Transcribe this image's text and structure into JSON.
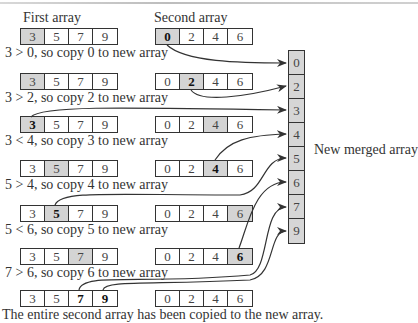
{
  "headers": {
    "first": "First array",
    "second": "Second array"
  },
  "steps": [
    {
      "first": [
        "3",
        "5",
        "7",
        "9"
      ],
      "first_shade": [
        0
      ],
      "first_bold": [],
      "second": [
        "0",
        "2",
        "4",
        "6"
      ],
      "second_shade": [
        0
      ],
      "second_bold": [
        0
      ],
      "caption": "3 > 0, so copy 0 to new array"
    },
    {
      "first": [
        "3",
        "5",
        "7",
        "9"
      ],
      "first_shade": [
        0
      ],
      "first_bold": [],
      "second": [
        "0",
        "2",
        "4",
        "6"
      ],
      "second_shade": [
        1
      ],
      "second_bold": [
        1
      ],
      "caption": "3 > 2, so copy 2 to new array"
    },
    {
      "first": [
        "3",
        "5",
        "7",
        "9"
      ],
      "first_shade": [
        0
      ],
      "first_bold": [
        0
      ],
      "second": [
        "0",
        "2",
        "4",
        "6"
      ],
      "second_shade": [
        2
      ],
      "second_bold": [],
      "caption": "3 < 4, so copy 3 to new array"
    },
    {
      "first": [
        "3",
        "5",
        "7",
        "9"
      ],
      "first_shade": [
        1
      ],
      "first_bold": [],
      "second": [
        "0",
        "2",
        "4",
        "6"
      ],
      "second_shade": [
        2
      ],
      "second_bold": [
        2
      ],
      "caption": "5 > 4, so copy 4 to new array"
    },
    {
      "first": [
        "3",
        "5",
        "7",
        "9"
      ],
      "first_shade": [
        1
      ],
      "first_bold": [
        1
      ],
      "second": [
        "0",
        "2",
        "4",
        "6"
      ],
      "second_shade": [
        3
      ],
      "second_bold": [],
      "caption": "5 < 6, so copy 5 to new array"
    },
    {
      "first": [
        "3",
        "5",
        "7",
        "9"
      ],
      "first_shade": [
        2
      ],
      "first_bold": [],
      "second": [
        "0",
        "2",
        "4",
        "6"
      ],
      "second_shade": [
        3
      ],
      "second_bold": [
        3
      ],
      "caption": "7 > 6, so copy 6 to new array"
    },
    {
      "first": [
        "3",
        "5",
        "7",
        "9"
      ],
      "first_shade": [],
      "first_bold": [
        2,
        3
      ],
      "second": [
        "0",
        "2",
        "4",
        "6"
      ],
      "second_shade": [],
      "second_bold": [],
      "caption": "The entire second array has been copied to the new array."
    }
  ],
  "merged": {
    "label": "New merged array",
    "values": [
      "0",
      "2",
      "3",
      "4",
      "5",
      "6",
      "7",
      "9"
    ]
  },
  "colors": {
    "shade": "#d4d4d4",
    "merged_fill": "#d6d6d6",
    "line": "#333333"
  }
}
